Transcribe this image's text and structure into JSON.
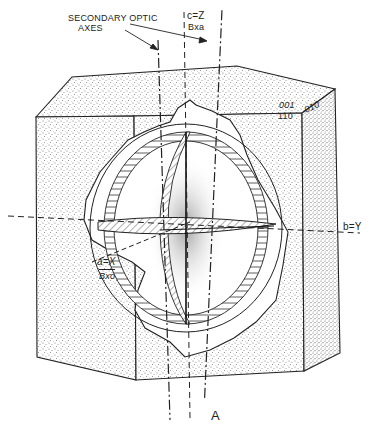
{
  "figure": {
    "title_label": "A",
    "labels": {
      "secondary_optic_axes_line1": "SECONDARY OPTIC",
      "secondary_optic_axes_line2": "AXES",
      "c_axis": "c=Z",
      "c_axis_sub": "Bxa",
      "b_axis": "b=Y",
      "a_axis": "a=X",
      "a_axis_sub": "Bxo",
      "face_001": "001",
      "face_110": "110",
      "face_010": "010"
    },
    "colors": {
      "ink": "#222222",
      "paper": "#ffffff",
      "stipple": "#8a8a8a"
    }
  }
}
